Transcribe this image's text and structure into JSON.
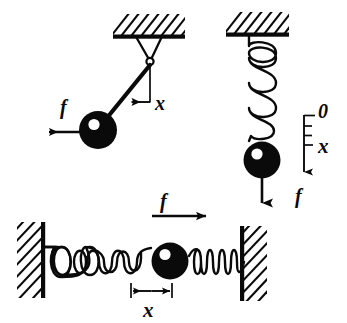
{
  "figure": {
    "background_color": "#ffffff",
    "ink_color": "#0a0a0a",
    "panels": [
      {
        "id": "pendulum",
        "name": "Simple pendulum with restoring force",
        "support": "hatched ceiling",
        "labels": {
          "force": "f",
          "displacement": "x"
        }
      },
      {
        "id": "vertical-spring",
        "name": "Mass hanging on vertical spring",
        "support": "hatched ceiling",
        "labels": {
          "force": "f",
          "origin": "0",
          "displacement": "x"
        },
        "scale_ticks": 4
      },
      {
        "id": "horizontal-spring",
        "name": "Mass between two horizontal springs fixed to walls",
        "support": "hatched walls left and right",
        "labels": {
          "force": "f",
          "displacement": "x"
        }
      }
    ],
    "symbols": {
      "force_label": "f",
      "displacement_label": "x",
      "origin_label": "0"
    }
  }
}
